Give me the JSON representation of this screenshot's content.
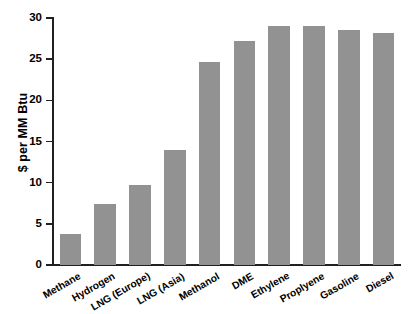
{
  "chart_data": {
    "type": "bar",
    "title": "",
    "xlabel": "",
    "ylabel": "$ per MM Btu",
    "ylim": [
      0,
      30
    ],
    "yticks": [
      0,
      5,
      10,
      15,
      20,
      25,
      30
    ],
    "ytick_labels": [
      "0",
      "5",
      "10",
      "15",
      "20",
      "25",
      "30"
    ],
    "grid": false,
    "legend": null,
    "bar_color": "#929292",
    "axis_color": "#231f20",
    "categories": [
      "Methane",
      "Hydrogen",
      "LNG (Europe)",
      "LNG (Asia)",
      "Methanol",
      "DME",
      "Ethylene",
      "Proplyene",
      "Gasoline",
      "Diesel"
    ],
    "values": [
      3.8,
      7.4,
      9.7,
      14.0,
      24.7,
      27.2,
      29.0,
      29.0,
      28.5,
      28.2
    ]
  }
}
